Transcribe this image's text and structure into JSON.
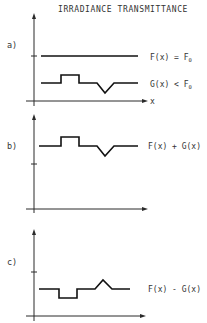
{
  "header": {
    "title": "IRRADIANCE TRANSMITTANCE"
  },
  "panels": [
    {
      "id": "a",
      "label": "a)",
      "x_axis_label": "x",
      "curves": [
        {
          "name": "F(x) = F0",
          "label_main": "F(x) = F",
          "label_sub": "0"
        },
        {
          "name": "G(x) < F0",
          "label_main": "G(x) < F",
          "label_sub": "0"
        }
      ]
    },
    {
      "id": "b",
      "label": "b)",
      "curves": [
        {
          "name": "F(x) + G(x)",
          "label_main": "F(x) + G(x)"
        }
      ]
    },
    {
      "id": "c",
      "label": "c)",
      "curves": [
        {
          "name": "F(x) - G(x)",
          "label_main": "F(x) - G(x)"
        }
      ]
    }
  ],
  "colors": {
    "line": "#111111",
    "axis": "#2a2a2a",
    "text": "#333333",
    "background": "#ffffff"
  }
}
